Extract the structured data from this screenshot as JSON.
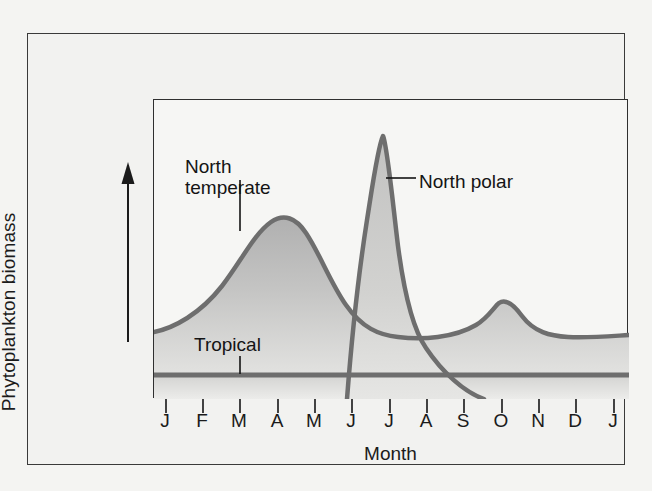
{
  "figure": {
    "y_axis_label": "Phytoplankton biomass",
    "x_axis_label": "Month",
    "arrow_icon": "up-arrow-icon",
    "frame_color": "#2f2f2f",
    "curve_color": "#6e6e6e",
    "fill_color_top": "#b9b9b9",
    "fill_color_bottom": "#d8d8d6",
    "background_color": "#f2f2f0"
  },
  "annotations": {
    "north_temperate": {
      "line1": "North",
      "line2": "temperate"
    },
    "north_polar": {
      "text": "North polar"
    },
    "tropical": {
      "text": "Tropical"
    }
  },
  "chart_data": {
    "type": "line",
    "title": "",
    "subtitle": "",
    "xlabel": "Month",
    "ylabel": "Phytoplankton biomass",
    "grid": false,
    "legend_position": "inline-annotations",
    "axis_tick_values_shown": false,
    "categories": [
      "J",
      "F",
      "M",
      "A",
      "M",
      "J",
      "J",
      "A",
      "S",
      "O",
      "N",
      "D",
      "J"
    ],
    "x": [
      1,
      2,
      3,
      4,
      5,
      6,
      7,
      8,
      9,
      10,
      11,
      12,
      13
    ],
    "xlim": [
      1,
      13
    ],
    "ylim": [
      0,
      100
    ],
    "series": [
      {
        "name": "North temperate",
        "label_x": 3.0,
        "peak_months": [
          "A",
          "O"
        ],
        "values": [
          24,
          33,
          52,
          70,
          55,
          40,
          32,
          27,
          26,
          36,
          28,
          24,
          23
        ]
      },
      {
        "name": "North polar",
        "label_x": 7.1,
        "peak_months": [
          "J"
        ],
        "values": [
          0,
          0,
          0,
          0,
          0,
          2,
          95,
          30,
          12,
          0,
          0,
          0,
          0
        ]
      },
      {
        "name": "Tropical",
        "label_x": 3.3,
        "peak_months": [],
        "values": [
          15,
          15,
          15,
          15,
          15,
          15,
          15,
          15,
          15,
          15,
          15,
          15,
          15
        ]
      }
    ]
  }
}
